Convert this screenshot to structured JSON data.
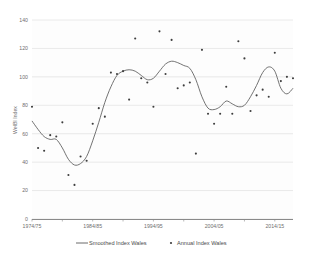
{
  "chart_data": {
    "type": "scatter",
    "title": "",
    "xlabel": "",
    "ylabel": "WelBI Index",
    "ylim": [
      0,
      140
    ],
    "ytick_values": [
      0,
      20,
      40,
      60,
      80,
      100,
      120,
      140
    ],
    "ytick_labels": [
      "0",
      "20",
      "40",
      "60",
      "80",
      "100",
      "120",
      "140"
    ],
    "xtick_labels": [
      "1974/75",
      "1984/85",
      "1994/95",
      "2004/05",
      "2014/15"
    ],
    "xtick_years": [
      1974,
      1984,
      1994,
      2004,
      2014
    ],
    "x_start_year": 1974,
    "x_end_year": 2017,
    "grid": true,
    "legend_position": "bottom",
    "series": [
      {
        "name": "Smoothed Index Wales",
        "type": "line",
        "color": "#5a5a5a",
        "x": [
          1974,
          1975,
          1976,
          1977,
          1978,
          1979,
          1980,
          1981,
          1982,
          1983,
          1984,
          1985,
          1986,
          1987,
          1988,
          1989,
          1990,
          1991,
          1992,
          1993,
          1994,
          1995,
          1996,
          1997,
          1998,
          1999,
          2000,
          2001,
          2002,
          2003,
          2004,
          2005,
          2006,
          2007,
          2008,
          2009,
          2010,
          2011,
          2012,
          2013,
          2014,
          2015,
          2016,
          2017
        ],
        "values": [
          69,
          63,
          58,
          56,
          56,
          50,
          42,
          38,
          39,
          44,
          55,
          68,
          82,
          93,
          101,
          104,
          105,
          104,
          101,
          98,
          99,
          104,
          109,
          111,
          110,
          108,
          106,
          98,
          86,
          78,
          77,
          79,
          83,
          81,
          79,
          80,
          86,
          94,
          103,
          107,
          104,
          92,
          88,
          92
        ]
      },
      {
        "name": "Annual Index Wales",
        "type": "scatter",
        "color": "#3d3d3d",
        "x": [
          1974,
          1975,
          1976,
          1977,
          1978,
          1979,
          1980,
          1981,
          1982,
          1983,
          1984,
          1985,
          1986,
          1987,
          1988,
          1989,
          1990,
          1991,
          1992,
          1993,
          1994,
          1995,
          1996,
          1997,
          1998,
          1999,
          2000,
          2001,
          2002,
          2003,
          2004,
          2005,
          2006,
          2007,
          2008,
          2009,
          2010,
          2011,
          2012,
          2013,
          2014,
          2015,
          2016,
          2017
        ],
        "values": [
          79,
          50,
          48,
          59,
          58,
          68,
          31,
          24,
          44,
          41,
          67,
          78,
          72,
          103,
          102,
          104,
          84,
          127,
          99,
          96,
          79,
          132,
          102,
          126,
          92,
          94,
          96,
          46,
          119,
          74,
          67,
          74,
          93,
          74,
          125,
          113,
          76,
          87,
          91,
          86,
          117,
          97,
          100,
          99
        ]
      }
    ]
  },
  "legend": {
    "items": [
      {
        "label": "Smoothed Index Wales",
        "marker": "line"
      },
      {
        "label": "Annual Index Wales",
        "marker": "dot"
      }
    ]
  }
}
